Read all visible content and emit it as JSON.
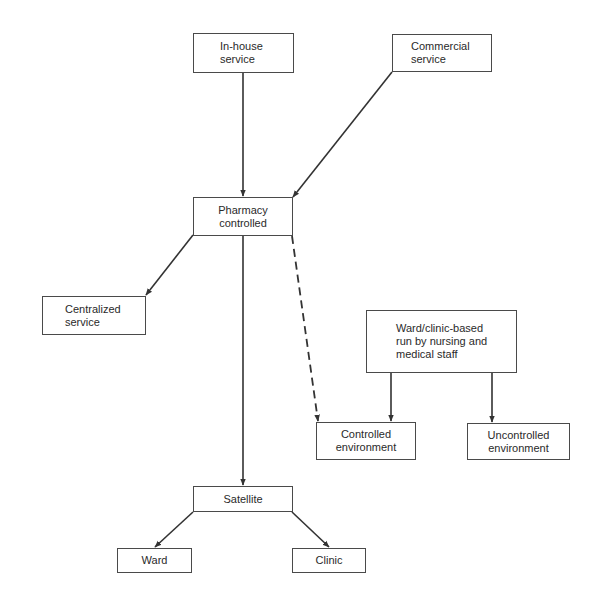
{
  "diagram": {
    "type": "flowchart",
    "colors": {
      "line": "#333333",
      "box_border": "#4a4a4a",
      "text": "#2a2a2a",
      "background": "#ffffff"
    },
    "nodes": {
      "in_house": {
        "label": "In-house\nservice"
      },
      "commercial": {
        "label": "Commercial\nservice"
      },
      "pharmacy": {
        "label": "Pharmacy\ncontrolled"
      },
      "centralized": {
        "label": "Centralized\nservice"
      },
      "ward_clinic_based": {
        "label": "Ward/clinic-based\nrun by nursing and\nmedical staff"
      },
      "controlled_env": {
        "label": "Controlled\nenvironment"
      },
      "uncontrolled_env": {
        "label": "Uncontrolled\nenvironment"
      },
      "satellite": {
        "label": "Satellite"
      },
      "ward": {
        "label": "Ward"
      },
      "clinic": {
        "label": "Clinic"
      }
    },
    "edges": [
      {
        "from": "in_house",
        "to": "pharmacy",
        "style": "solid"
      },
      {
        "from": "commercial",
        "to": "pharmacy",
        "style": "solid"
      },
      {
        "from": "pharmacy",
        "to": "centralized",
        "style": "solid"
      },
      {
        "from": "pharmacy",
        "to": "satellite",
        "style": "solid"
      },
      {
        "from": "pharmacy",
        "to": "controlled_env",
        "style": "dashed"
      },
      {
        "from": "ward_clinic_based",
        "to": "controlled_env",
        "style": "solid"
      },
      {
        "from": "ward_clinic_based",
        "to": "uncontrolled_env",
        "style": "solid"
      },
      {
        "from": "satellite",
        "to": "ward",
        "style": "solid"
      },
      {
        "from": "satellite",
        "to": "clinic",
        "style": "solid"
      }
    ]
  }
}
